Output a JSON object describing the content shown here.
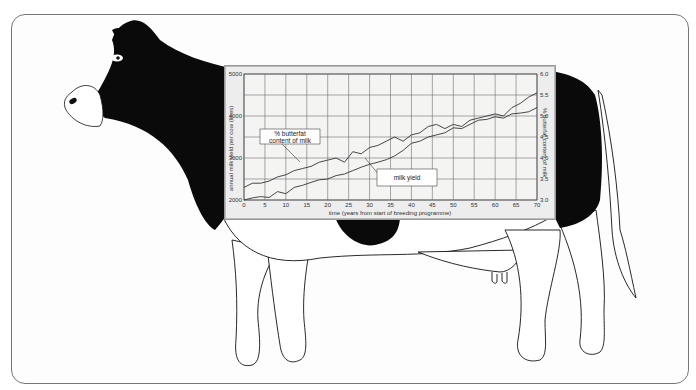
{
  "chart_data": {
    "type": "line",
    "title": "",
    "xlabel": "time (years from start of breeding programme)",
    "ylabel": "annual milk yield per cow (litres)",
    "ylabel_right": "% butterfat content of milk",
    "x_ticks": [
      "0",
      "5",
      "10",
      "15",
      "20",
      "25",
      "30",
      "35",
      "40",
      "45",
      "50",
      "55",
      "60",
      "65",
      "70"
    ],
    "y_ticks": [
      "2000",
      "",
      "3000",
      "",
      "4000",
      "",
      "5000"
    ],
    "y_ticks_right": [
      "3.0",
      "3.5",
      "4.0",
      "4.5",
      "5.0",
      "5.5",
      "6.0"
    ],
    "xlim": [
      0,
      70
    ],
    "ylim": [
      2000,
      5000
    ],
    "ylim_right": [
      3.0,
      6.0
    ],
    "grid": true,
    "x": [
      0,
      2,
      4,
      6,
      8,
      10,
      12,
      14,
      16,
      18,
      20,
      22,
      24,
      26,
      28,
      30,
      32,
      34,
      36,
      38,
      40,
      42,
      44,
      46,
      48,
      50,
      52,
      54,
      56,
      58,
      60,
      62,
      64,
      66,
      68,
      70
    ],
    "series": [
      {
        "name": "% butterfat content of milk",
        "axis": "right",
        "values": [
          3.3,
          3.4,
          3.4,
          3.45,
          3.55,
          3.6,
          3.7,
          3.75,
          3.8,
          3.9,
          3.95,
          4.0,
          3.9,
          4.15,
          4.1,
          4.25,
          4.3,
          4.4,
          4.5,
          4.4,
          4.55,
          4.6,
          4.75,
          4.8,
          4.7,
          4.8,
          4.75,
          4.9,
          4.95,
          5.0,
          5.05,
          5.0,
          5.2,
          5.3,
          5.45,
          5.55
        ]
      },
      {
        "name": "milk yield",
        "axis": "left",
        "values": [
          2000,
          2050,
          2080,
          2060,
          2200,
          2150,
          2300,
          2350,
          2420,
          2480,
          2500,
          2580,
          2620,
          2700,
          2780,
          2850,
          2900,
          2960,
          3050,
          3180,
          3350,
          3400,
          3500,
          3550,
          3600,
          3720,
          3700,
          3800,
          3900,
          3920,
          3980,
          3950,
          4050,
          4070,
          4100,
          4200
        ]
      }
    ],
    "annotations": [
      {
        "text_line1": "% butterfat",
        "text_line2": "content of milk",
        "points_to": "% butterfat content of milk"
      },
      {
        "text_line1": "milk yield",
        "points_to": "milk yield"
      }
    ]
  },
  "labels": {
    "butterfat_line1": "% butterfat",
    "butterfat_line2": "content of milk",
    "milk_yield": "milk yield"
  },
  "colors": {
    "cow_black": "#0a0a0a",
    "panel_bg": "#ecedec",
    "grid": "#555555",
    "line": "#333333"
  }
}
